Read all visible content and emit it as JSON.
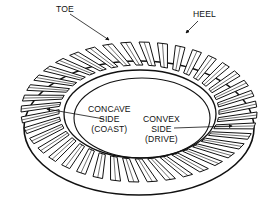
{
  "diagram": {
    "colors": {
      "line": "#111111",
      "background": "#ffffff"
    },
    "labels": {
      "toe": "TOE",
      "heel": "HEEL",
      "concave": {
        "line1": "CONCAVE",
        "line2": "SIDE",
        "line3": "(COAST)"
      },
      "convex": {
        "line1": "CONVEX",
        "line2": "SIDE",
        "line3": "(DRIVE)"
      }
    }
  }
}
